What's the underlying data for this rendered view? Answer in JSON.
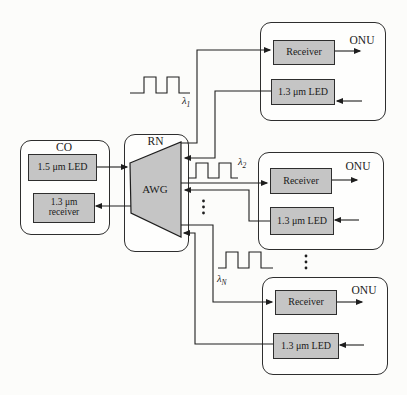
{
  "diagram": {
    "co": {
      "title": "CO",
      "led_label": "1.5 μm LED",
      "receiver_line1": "1.3 μm",
      "receiver_line2": "receiver"
    },
    "rn": {
      "title": "RN",
      "awg_label": "AWG"
    },
    "onus": [
      {
        "title": "ONU",
        "receiver_label": "Receiver",
        "led_label": "1.3 μm LED"
      },
      {
        "title": "ONU",
        "receiver_label": "Receiver",
        "led_label": "1.3 μm LED"
      },
      {
        "title": "ONU",
        "receiver_label": "Receiver",
        "led_label": "1.3 μm LED"
      }
    ],
    "waves": [
      {
        "symbol": "λ",
        "sub": "1"
      },
      {
        "symbol": "λ",
        "sub": "2"
      },
      {
        "symbol": "λ",
        "sub": "N"
      }
    ]
  },
  "colors": {
    "component_fill": "#c5c5c5",
    "line": "#1e1e1e",
    "background": "#fcfcfa"
  }
}
